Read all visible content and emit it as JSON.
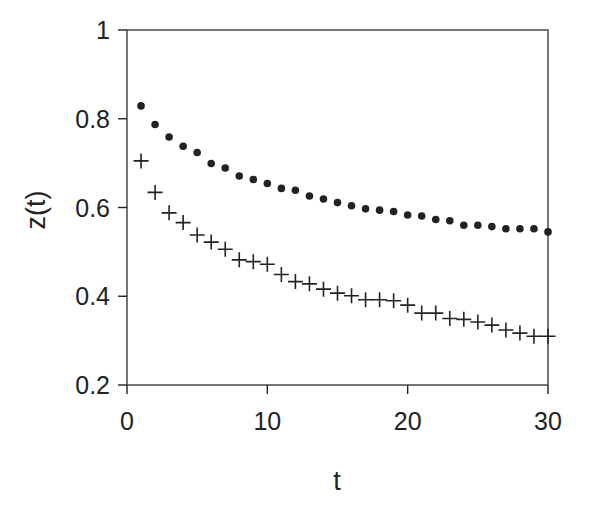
{
  "chart_data": {
    "type": "scatter",
    "title": "",
    "xlabel": "t",
    "ylabel": "z(t)",
    "xlim": [
      0,
      30
    ],
    "ylim": [
      0.2,
      1
    ],
    "xticks": [
      0,
      10,
      20,
      30
    ],
    "xtick_labels": [
      "0",
      "10",
      "20",
      "30"
    ],
    "yticks": [
      0.2,
      0.4,
      0.6,
      0.8,
      1
    ],
    "ytick_labels": [
      "0.2",
      "0.4",
      "0.6",
      "0.8",
      "1"
    ],
    "grid": false,
    "legend": null,
    "x": [
      1,
      2,
      3,
      4,
      5,
      6,
      7,
      8,
      9,
      10,
      11,
      12,
      13,
      14,
      15,
      16,
      17,
      18,
      19,
      20,
      21,
      22,
      23,
      24,
      25,
      26,
      27,
      28,
      29,
      30
    ],
    "series": [
      {
        "name": "dots",
        "marker": "filled-circle",
        "color": "#222222",
        "values": [
          0.829,
          0.787,
          0.759,
          0.738,
          0.724,
          0.699,
          0.689,
          0.671,
          0.663,
          0.654,
          0.643,
          0.639,
          0.626,
          0.619,
          0.611,
          0.604,
          0.597,
          0.594,
          0.591,
          0.583,
          0.581,
          0.573,
          0.57,
          0.56,
          0.56,
          0.557,
          0.552,
          0.552,
          0.552,
          0.545
        ]
      },
      {
        "name": "crosses",
        "marker": "plus",
        "color": "#222222",
        "values": [
          0.705,
          0.634,
          0.588,
          0.566,
          0.538,
          0.522,
          0.506,
          0.482,
          0.478,
          0.472,
          0.449,
          0.433,
          0.428,
          0.416,
          0.407,
          0.401,
          0.392,
          0.392,
          0.39,
          0.38,
          0.362,
          0.362,
          0.35,
          0.348,
          0.342,
          0.335,
          0.324,
          0.317,
          0.31,
          0.31
        ]
      }
    ]
  },
  "colors": {
    "axis": "#555555",
    "ink": "#222222",
    "background": "#ffffff"
  }
}
